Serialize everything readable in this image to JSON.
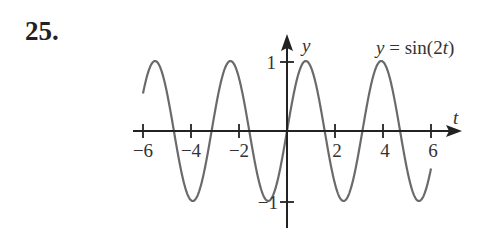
{
  "problem": {
    "number": "25."
  },
  "chart_data": {
    "type": "line",
    "title": "",
    "function_label": "y = sin(2t)",
    "xlabel": "t",
    "ylabel": "y",
    "xlim": [
      -6.3,
      7.3
    ],
    "ylim": [
      -1.4,
      1.4
    ],
    "x_ticks": [
      -6,
      -4,
      -2,
      2,
      4,
      6
    ],
    "x_tick_labels": [
      "−6",
      "−4",
      "−2",
      "2",
      "4",
      "6"
    ],
    "y_ticks": [
      1,
      -1
    ],
    "y_tick_labels": [
      "1",
      "−1"
    ],
    "grid": false,
    "legend": "none",
    "series": [
      {
        "name": "y = sin(2t)",
        "domain": [
          -6,
          6
        ],
        "x": [
          -6,
          -5.5,
          -5,
          -4.5,
          -4,
          -3.5,
          -3,
          -2.5,
          -2,
          -1.5,
          -1,
          -0.5,
          0,
          0.5,
          1,
          1.5,
          2,
          2.5,
          3,
          3.5,
          4,
          4.5,
          5,
          5.5,
          6
        ],
        "values": [
          0.54,
          1.0,
          0.54,
          -0.41,
          -0.99,
          -0.66,
          0.28,
          0.96,
          0.76,
          -0.14,
          -0.91,
          -0.84,
          0,
          0.84,
          0.91,
          0.14,
          -0.76,
          -0.96,
          -0.28,
          0.66,
          0.99,
          0.41,
          -0.54,
          -1.0,
          -0.54
        ]
      }
    ]
  },
  "labels": {
    "x_axis": "t",
    "y_axis": "y",
    "func_y": "y",
    "func_eq": " = sin(2",
    "func_t": "t",
    "func_close": ")",
    "tick_neg6": "−6",
    "tick_neg4": "−4",
    "tick_neg2": "−2",
    "tick_2": "2",
    "tick_4": "4",
    "tick_6": "6",
    "tick_y1": "1",
    "tick_yneg1": "−1"
  },
  "colors": {
    "axis": "#222222",
    "curve": "#666666",
    "text": "#333333"
  }
}
